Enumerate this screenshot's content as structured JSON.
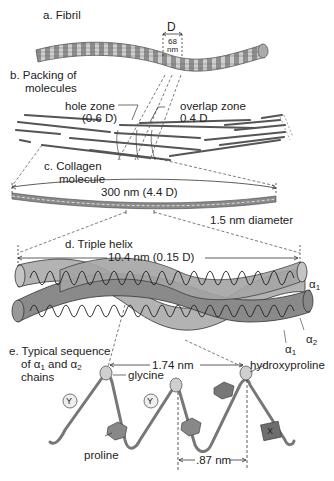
{
  "diagram": {
    "panels": {
      "a": {
        "label": "a. Fibril",
        "period_symbol": "D",
        "period_value": "68",
        "period_unit": "nm"
      },
      "b": {
        "label_line1": "b. Packing of",
        "label_line2": "molecules",
        "hole_zone_line1": "hole zone",
        "hole_zone_line2": "(0.6 D)",
        "overlap_zone_line1": "overlap zone",
        "overlap_zone_line2": "0.4 D"
      },
      "c": {
        "label_line1": "c. Collagen",
        "label_line2": "molecule",
        "length": "300 nm (4.4 D)",
        "diameter": "1.5 nm diameter"
      },
      "d": {
        "label": "d. Triple helix",
        "pitch": "10.4 nm (0.15 D)",
        "chain_alpha1_top": "α",
        "chain_alpha1_top_sub": "1",
        "chain_alpha2": "α",
        "chain_alpha2_sub": "2",
        "chain_alpha1_bottom": "α",
        "chain_alpha1_bottom_sub": "1"
      },
      "e": {
        "label_line1": "e. Typical sequence",
        "label_line2_pre": "of α",
        "label_line2_sub1": "1",
        "label_line2_mid": " and α",
        "label_line2_sub2": "2",
        "label_line3": "chains",
        "repeat_distance": "1.74 nm",
        "glycine": "glycine",
        "hydroxyproline": "hydroxyproline",
        "proline": "proline",
        "residue_distance": ".87 nm",
        "residue_y1": "Y",
        "residue_y2": "Y",
        "residue_x": "X"
      }
    },
    "colors": {
      "ribbon_light": "#b8b8b8",
      "ribbon_dark": "#7d7d7d",
      "line": "#333333",
      "fibril": "#8a8a8a"
    }
  }
}
